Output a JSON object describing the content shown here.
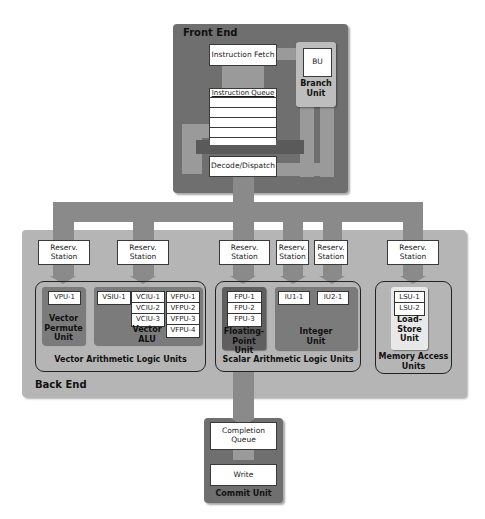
{
  "front_end": {
    "title": "Front End",
    "instruction_fetch": "Instruction Fetch",
    "instruction_queue": "Instruction Queue",
    "queue_rows": 5,
    "decode_dispatch": "Decode/Dispatch",
    "branch_unit": {
      "chip": "BU",
      "label_line1": "Branch",
      "label_line2": "Unit"
    }
  },
  "back_end": {
    "title": "Back End",
    "reservation_station": {
      "line1": "Reserv.",
      "line2": "Station"
    },
    "groups": [
      {
        "label": "Vector Arithmetic Logic Units",
        "units": [
          {
            "name": "Vector Permute Unit",
            "label_lines": [
              "Vector",
              "Permute",
              "Unit"
            ],
            "chips": [
              "VPU-1"
            ]
          },
          {
            "name": "Vector ALU",
            "label_lines": [
              "Vector",
              "ALU"
            ],
            "chips_col1": [
              "VSIU-1"
            ],
            "chips_col2": [
              "VCIU-1",
              "VCIU-2",
              "VCIU-3"
            ],
            "chips_col3": [
              "VFPU-1",
              "VFPU-2",
              "VFPU-3",
              "VFPU-4"
            ]
          }
        ]
      },
      {
        "label": "Scalar Arithmetic Logic Units",
        "units": [
          {
            "name": "Floating-Point Unit",
            "label_lines": [
              "Floating-",
              "Point Unit"
            ],
            "chips": [
              "FPU-1",
              "FPU-2",
              "FPU-3"
            ]
          },
          {
            "name": "Integer Unit",
            "label_lines": [
              "Integer",
              "Unit"
            ],
            "chips": [
              "IU1-1",
              "IU2-1"
            ]
          }
        ]
      },
      {
        "label_lines": [
          "Memory Access",
          "Units"
        ],
        "units": [
          {
            "name": "Load-Store Unit",
            "label_lines": [
              "Load-",
              "Store",
              "Unit"
            ],
            "chips": [
              "LSU-1",
              "LSU-2"
            ]
          }
        ]
      }
    ]
  },
  "commit_unit": {
    "title": "Commit Unit",
    "completion_queue": {
      "line1": "Completion",
      "line2": "Queue"
    },
    "write": "Write"
  },
  "colors": {
    "front_end_bg": "#6f6f6f",
    "bus": "#8a8a8a",
    "back_end_bg": "#b5b5b5",
    "unit_bg": "#7b7b7b",
    "fpu_bg": "#5f5f5f",
    "lsu_bg": "#e8e8e8",
    "branch_unit_bg": "#bdbdbd"
  }
}
